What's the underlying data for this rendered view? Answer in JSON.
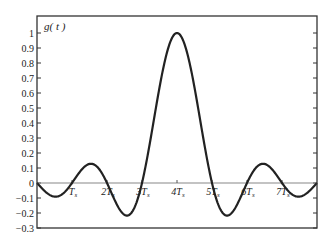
{
  "chart_data": {
    "type": "line",
    "title": "",
    "ylabel_inside": "g( t )",
    "xlabel": "",
    "ylim": [
      -0.3,
      1.1
    ],
    "xlim": [
      0,
      8
    ],
    "yticks": [
      -0.3,
      -0.2,
      -0.1,
      0,
      0.1,
      0.2,
      0.3,
      0.4,
      0.5,
      0.6,
      0.7,
      0.8,
      0.9,
      1
    ],
    "ytick_labels": [
      "−0.3",
      "−0.2",
      "−0.1",
      "0",
      "0.1",
      "0.2",
      "0.3",
      "0.4",
      "0.5",
      "0.6",
      "0.7",
      "0.8",
      "0.9",
      "1"
    ],
    "xtick_labels": [
      "T_s",
      "2T_s",
      "3T_s",
      "4T_s",
      "5T_s",
      "6T_s",
      "7T_s"
    ],
    "xtick_positions": [
      1,
      2,
      3,
      4,
      5,
      6,
      7
    ],
    "grid": false,
    "series": [
      {
        "name": "g(t)",
        "description": "sinc pulse centered at 4Ts, zeros at integer multiples of Ts",
        "x": [
          0,
          0.5,
          1,
          1.5,
          2,
          2.5,
          2.57,
          3,
          3.5,
          4,
          4.5,
          5,
          5.43,
          5.5,
          6,
          6.5,
          7,
          7.5,
          8
        ],
        "values": [
          0,
          -0.09,
          0,
          0.128,
          0,
          -0.212,
          -0.217,
          0,
          0.637,
          1,
          0.637,
          0,
          -0.217,
          -0.212,
          0,
          0.128,
          0,
          -0.09,
          0
        ]
      }
    ]
  }
}
